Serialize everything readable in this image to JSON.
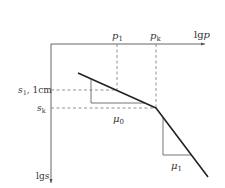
{
  "axes": {
    "x_label": "lgp",
    "x_label_prefix": "lg",
    "x_label_var": "p",
    "y_label": "lgs",
    "y_label_prefix": "lg",
    "y_label_var": "s"
  },
  "x_marks": [
    {
      "var": "p",
      "sub": "1",
      "label": "p1"
    },
    {
      "var": "p",
      "sub": "k",
      "label": "pk"
    }
  ],
  "y_marks": [
    {
      "var": "s",
      "sub": "1",
      "suffix": ", 1cm",
      "label": "s1, 1cm"
    },
    {
      "var": "s",
      "sub": "k",
      "suffix": "",
      "label": "sk"
    }
  ],
  "slopes": [
    {
      "var": "μ",
      "sub": "0",
      "label": "μ0"
    },
    {
      "var": "μ",
      "sub": "1",
      "label": "μ1"
    }
  ],
  "colors": {
    "axis": "#555555",
    "curve": "#222222",
    "dashed": "#777777",
    "triangle": "#666666"
  }
}
